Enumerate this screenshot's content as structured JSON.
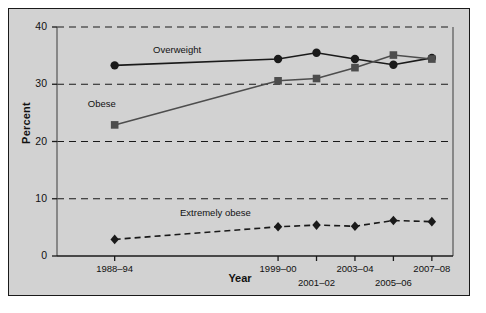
{
  "chart_data": {
    "type": "line",
    "title": "",
    "xlabel": "Year",
    "ylabel": "Percent",
    "ylim": [
      0,
      40
    ],
    "yticks": [
      0,
      10,
      20,
      30,
      40
    ],
    "grid": "horizontal-dashed",
    "legend": "inline-labels",
    "categories": [
      "1988–94",
      "1999–00",
      "2001–02",
      "2003–04",
      "2005–06",
      "2007–08"
    ],
    "x_positions": [
      1991,
      1999.5,
      2001.5,
      2003.5,
      2005.5,
      2007.5
    ],
    "series": [
      {
        "name": "Overweight",
        "marker": "circle",
        "linestyle": "solid",
        "color": "#1a1a1a",
        "values": [
          33.3,
          34.4,
          35.5,
          34.4,
          33.4,
          34.6
        ]
      },
      {
        "name": "Obese",
        "marker": "square",
        "linestyle": "solid",
        "color": "#4d4d4d",
        "values": [
          22.9,
          30.6,
          31.0,
          32.9,
          35.1,
          34.4
        ]
      },
      {
        "name": "Extremely obese",
        "marker": "diamond",
        "linestyle": "dashed",
        "color": "#1a1a1a",
        "values": [
          2.9,
          5.1,
          5.4,
          5.2,
          6.2,
          6.0
        ]
      }
    ],
    "annotations": [
      {
        "text": "Overweight",
        "series": "Overweight"
      },
      {
        "text": "Obese",
        "series": "Obese"
      },
      {
        "text": "Extremely obese",
        "series": "Extremely obese"
      }
    ]
  },
  "axis": {
    "y_title": "Percent",
    "x_title": "Year",
    "y_tick_labels": [
      "40",
      "30",
      "20",
      "10",
      "0"
    ],
    "x_tick_labels": [
      "1988–94",
      "1999–00",
      "2001–02",
      "2003–04",
      "2005–06",
      "2007–08"
    ]
  },
  "colors": {
    "background": "#d2d2d2",
    "frame": "#1a1a1a",
    "overweight": "#1a1a1a",
    "obese": "#4d4d4d",
    "extremely_obese": "#1a1a1a",
    "grid": "#1a1a1a"
  }
}
